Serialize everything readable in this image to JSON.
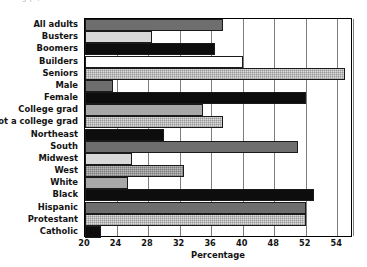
{
  "title_partial": "a  g                                                    p      ,",
  "chart_data": {
    "type": "bar",
    "orientation": "horizontal",
    "title": "",
    "xlabel": "Percentage",
    "ylabel": "",
    "xlim": [
      20,
      54
    ],
    "ylim": null,
    "grid": true,
    "legend": "none",
    "xticks": [
      20,
      24,
      28,
      32,
      36,
      40,
      44,
      48,
      52,
      54
    ],
    "xtick_labels": [
      "20",
      "24",
      "28",
      "32",
      "36",
      "40",
      "48",
      "52",
      "54"
    ],
    "categories": [
      "All adults",
      "Busters",
      "Boomers",
      "Builders",
      "Seniors",
      "Male",
      "Female",
      "College grad",
      "Not a college grad",
      "Northeast",
      "South",
      "Midwest",
      "West",
      "White",
      "Black",
      "Hispanic",
      "Protestant",
      "Catholic"
    ],
    "values": [
      37.5,
      28.5,
      36.5,
      40.0,
      53.0,
      23.5,
      48.0,
      35.0,
      37.5,
      30.0,
      47.0,
      26.0,
      32.5,
      25.5,
      49.0,
      48.0,
      48.0,
      22.0
    ],
    "bar_styles": [
      "dark-gray",
      "light-gray",
      "black",
      "white",
      "light-gray-hatched",
      "dark-gray",
      "black",
      "mid-gray",
      "light-gray-hatched",
      "black",
      "dark-gray",
      "light-gray",
      "hatched-mid",
      "mid-gray",
      "black",
      "dark-gray",
      "light-gray-hatched",
      "black"
    ]
  },
  "colors": {
    "dark_gray": "#6e6e6e",
    "black": "#0d0d0d",
    "white": "#ffffff",
    "light_gray": "#d8d8d8",
    "mid_gray": "#a8a8a8",
    "axis": "#000000",
    "grid": "#7d7d7d",
    "text": "#131313",
    "background": "#ffffff"
  }
}
